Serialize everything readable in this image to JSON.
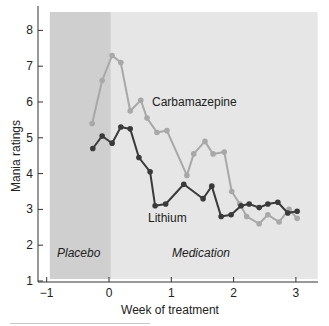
{
  "chart_data": {
    "type": "line",
    "title": "",
    "xlabel": "Week of treatment",
    "ylabel": "Mania ratings",
    "xlim": [
      -1.1,
      3.35
    ],
    "ylim": [
      1,
      8.5
    ],
    "x_ticks": [
      -1,
      0,
      1,
      2,
      3
    ],
    "x_tick_labels": [
      "−1",
      "0",
      "1",
      "2",
      "3"
    ],
    "y_ticks": [
      1,
      2,
      3,
      4,
      5,
      6,
      7,
      8
    ],
    "y_tick_labels": [
      "1",
      "2",
      "3",
      "4",
      "5",
      "6",
      "7",
      "8"
    ],
    "grid": false,
    "legend": "inline labels",
    "regions": [
      {
        "name": "Placebo",
        "x_start": -0.95,
        "x_end": 0.03,
        "color": "#cfcfcf"
      },
      {
        "name": "Medication",
        "x_start": 0.03,
        "x_end": 3.35,
        "color": "#e6e6e6"
      }
    ],
    "series": [
      {
        "name": "Carbamazepine",
        "color": "#a8a8a8",
        "x": [
          -0.27,
          -0.11,
          0.05,
          0.19,
          0.34,
          0.51,
          0.61,
          0.77,
          0.93,
          1.25,
          1.36,
          1.54,
          1.67,
          1.85,
          1.97,
          2.1,
          2.21,
          2.41,
          2.55,
          2.73,
          2.89,
          3.02
        ],
        "values": [
          5.4,
          6.6,
          7.3,
          7.1,
          5.75,
          6.05,
          5.55,
          5.15,
          5.2,
          3.95,
          4.55,
          4.9,
          4.55,
          4.6,
          3.5,
          3.15,
          2.8,
          2.6,
          2.85,
          2.65,
          3.0,
          2.75
        ]
      },
      {
        "name": "Lithium",
        "color": "#3a3a3a",
        "x": [
          -0.26,
          -0.11,
          0.05,
          0.19,
          0.34,
          0.48,
          0.66,
          0.74,
          0.91,
          1.2,
          1.51,
          1.65,
          1.8,
          1.96,
          2.12,
          2.25,
          2.41,
          2.55,
          2.71,
          2.87,
          3.02
        ],
        "values": [
          4.7,
          5.05,
          4.85,
          5.3,
          5.25,
          4.45,
          4.05,
          3.1,
          3.15,
          3.7,
          3.3,
          3.65,
          2.8,
          2.85,
          3.1,
          3.15,
          3.05,
          3.15,
          3.2,
          2.9,
          2.95
        ]
      }
    ],
    "annotations": [
      {
        "text": "Carbamazepine",
        "x": 0.67,
        "y": 6.0
      },
      {
        "text": "Lithium",
        "x": 0.62,
        "y": 2.8
      },
      {
        "text": "Placebo",
        "x": -0.83,
        "y": 1.85,
        "style": "italic"
      },
      {
        "text": "Medication",
        "x": 0.98,
        "y": 1.85,
        "style": "italic"
      }
    ]
  },
  "labels": {
    "xlabel": "Week of treatment",
    "ylabel": "Mania ratings",
    "carbamazepine": "Carbamazepine",
    "lithium": "Lithium",
    "placebo": "Placebo",
    "medication": "Medication"
  }
}
